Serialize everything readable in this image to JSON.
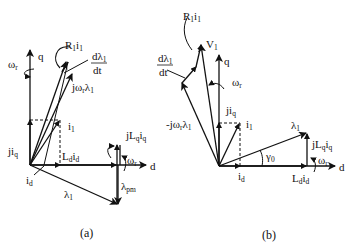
{
  "figure": {
    "clipped_header_text": "",
    "panels": [
      {
        "id": "a",
        "caption": "(a)",
        "axes": {
          "q": "q",
          "d": "d"
        },
        "labels": {
          "R1i1": [
            "R",
            "1",
            "i",
            "1"
          ],
          "dlambda_dt_num": [
            "dλ",
            "1"
          ],
          "dlambda_dt_den": "dt",
          "jw_lambda": [
            "jω",
            "r",
            "λ",
            "1"
          ],
          "omega_r_q": [
            "ω",
            "r"
          ],
          "i1": [
            "i",
            "1"
          ],
          "jiq": [
            "ji",
            "q"
          ],
          "Ldid": [
            "L",
            "d",
            "i",
            "d"
          ],
          "jLqiq": [
            "jL",
            "q",
            "i",
            "q"
          ],
          "omega_r_d": [
            "ω",
            "r"
          ],
          "id": [
            "i",
            "d"
          ],
          "lambda1": [
            "λ",
            "1"
          ],
          "lambda_pm": [
            "λ",
            "pm"
          ]
        }
      },
      {
        "id": "b",
        "caption": "(b)",
        "axes": {
          "q": "q",
          "d": "d"
        },
        "labels": {
          "R1i1": [
            "R",
            "1",
            "i",
            "1"
          ],
          "V1": [
            "V",
            "1"
          ],
          "dlambda_dt_num": [
            "dλ",
            "1"
          ],
          "dlambda_dt_den": "dt",
          "neg_jw_lambda": [
            "-jω",
            "r",
            "λ",
            "1"
          ],
          "omega_r_q": [
            "ω",
            "r"
          ],
          "jiq": [
            "ji",
            "q"
          ],
          "i1": [
            "i",
            "1"
          ],
          "lambda1": [
            "λ",
            "1"
          ],
          "jLqiq": [
            "jL",
            "q",
            "i",
            "q"
          ],
          "gamma0": [
            "γ",
            "0"
          ],
          "omega_r_d": [
            "ω",
            "r"
          ],
          "id": [
            "i",
            "d"
          ],
          "Ldid": [
            "L",
            "d",
            "i",
            "d"
          ]
        }
      }
    ]
  }
}
